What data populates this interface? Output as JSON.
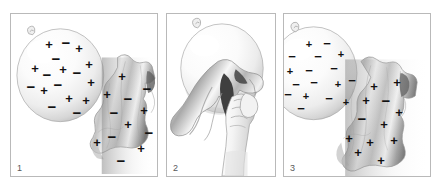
{
  "figure": {
    "background_color": "#ffffff",
    "border_color": "#b9b9b9",
    "charge_color": "#111111",
    "number_color": "#58585a",
    "panel_count": 3
  },
  "panels": [
    {
      "number": "1",
      "caption": "",
      "scene": "balloon-and-cloth-neutral",
      "objects": [
        {
          "name": "balloon",
          "charge_state": "neutral",
          "description": "inflated balloon with knot at top-left, equal mix of positive and negative charges"
        },
        {
          "name": "cloth",
          "charge_state": "neutral",
          "description": "draped fabric cloth with equal mix of positive and negative charges"
        }
      ],
      "balloon_charges": [
        {
          "sign": "+",
          "x": 38,
          "y": 30
        },
        {
          "sign": "−",
          "x": 55,
          "y": 28
        },
        {
          "sign": "+",
          "x": 68,
          "y": 34
        },
        {
          "sign": "−",
          "x": 45,
          "y": 44
        },
        {
          "sign": "+",
          "x": 24,
          "y": 54
        },
        {
          "sign": "+",
          "x": 52,
          "y": 55
        },
        {
          "sign": "−",
          "x": 36,
          "y": 60
        },
        {
          "sign": "−",
          "x": 66,
          "y": 58
        },
        {
          "sign": "+",
          "x": 78,
          "y": 50
        },
        {
          "sign": "−",
          "x": 20,
          "y": 72
        },
        {
          "sign": "+",
          "x": 33,
          "y": 76
        },
        {
          "sign": "−",
          "x": 47,
          "y": 70
        },
        {
          "sign": "+",
          "x": 80,
          "y": 68
        },
        {
          "sign": "+",
          "x": 58,
          "y": 84
        },
        {
          "sign": "+",
          "x": 75,
          "y": 86
        },
        {
          "sign": "−",
          "x": 41,
          "y": 92
        },
        {
          "sign": "−",
          "x": 66,
          "y": 98
        }
      ],
      "cloth_charges": [
        {
          "sign": "+",
          "x": 111,
          "y": 62
        },
        {
          "sign": "−",
          "x": 136,
          "y": 74
        },
        {
          "sign": "+",
          "x": 96,
          "y": 80
        },
        {
          "sign": "−",
          "x": 117,
          "y": 84
        },
        {
          "sign": "−",
          "x": 103,
          "y": 98
        },
        {
          "sign": "+",
          "x": 133,
          "y": 96
        },
        {
          "sign": "+",
          "x": 117,
          "y": 110
        },
        {
          "sign": "−",
          "x": 138,
          "y": 118
        },
        {
          "sign": "−",
          "x": 101,
          "y": 122
        },
        {
          "sign": "+",
          "x": 86,
          "y": 128
        },
        {
          "sign": "+",
          "x": 130,
          "y": 134
        },
        {
          "sign": "−",
          "x": 110,
          "y": 146
        }
      ]
    },
    {
      "number": "2",
      "caption": "",
      "scene": "hand-rubbing-balloon-with-cloth",
      "objects": [
        {
          "name": "balloon",
          "charge_state": "charging",
          "description": "balloon held from above, knot at top-left"
        },
        {
          "name": "cloth",
          "charge_state": "charging",
          "description": "cloth pressed against balloon surface"
        },
        {
          "name": "hand",
          "charge_state": "none",
          "description": "hand gripping cloth, rubbing it across the balloon"
        }
      ],
      "balloon_charges": [],
      "cloth_charges": []
    },
    {
      "number": "3",
      "caption": "",
      "scene": "balloon-negative-cloth-positive",
      "objects": [
        {
          "name": "balloon",
          "charge_state": "negative",
          "description": "balloon now carrying net negative charge, mostly minus signs"
        },
        {
          "name": "cloth",
          "charge_state": "positive",
          "description": "cloth now carrying net positive charge, mostly plus signs"
        }
      ],
      "balloon_charges": [
        {
          "sign": "+",
          "x": 25,
          "y": 30
        },
        {
          "sign": "−",
          "x": 43,
          "y": 29
        },
        {
          "sign": "−",
          "x": 8,
          "y": 42
        },
        {
          "sign": "−",
          "x": 34,
          "y": 42
        },
        {
          "sign": "+",
          "x": 57,
          "y": 40
        },
        {
          "sign": "+",
          "x": 6,
          "y": 57
        },
        {
          "sign": "−",
          "x": 25,
          "y": 56
        },
        {
          "sign": "−",
          "x": 50,
          "y": 54
        },
        {
          "sign": "−",
          "x": 12,
          "y": 70
        },
        {
          "sign": "−",
          "x": 30,
          "y": 68
        },
        {
          "sign": "+",
          "x": 54,
          "y": 70
        },
        {
          "sign": "−",
          "x": 68,
          "y": 66
        },
        {
          "sign": "−",
          "x": 4,
          "y": 80
        },
        {
          "sign": "+",
          "x": 22,
          "y": 82
        },
        {
          "sign": "−",
          "x": 45,
          "y": 84
        },
        {
          "sign": "−",
          "x": 17,
          "y": 94
        },
        {
          "sign": "+",
          "x": 62,
          "y": 88
        }
      ],
      "cloth_charges": [
        {
          "sign": "+",
          "x": 90,
          "y": 72
        },
        {
          "sign": "+",
          "x": 113,
          "y": 68
        },
        {
          "sign": "+",
          "x": 82,
          "y": 86
        },
        {
          "sign": "−",
          "x": 102,
          "y": 86
        },
        {
          "sign": "+",
          "x": 115,
          "y": 98
        },
        {
          "sign": "−",
          "x": 78,
          "y": 104
        },
        {
          "sign": "+",
          "x": 100,
          "y": 110
        },
        {
          "sign": "+",
          "x": 65,
          "y": 124
        },
        {
          "sign": "+",
          "x": 86,
          "y": 128
        },
        {
          "sign": "+",
          "x": 110,
          "y": 126
        },
        {
          "sign": "+",
          "x": 74,
          "y": 138
        },
        {
          "sign": "+",
          "x": 97,
          "y": 146
        }
      ]
    }
  ]
}
